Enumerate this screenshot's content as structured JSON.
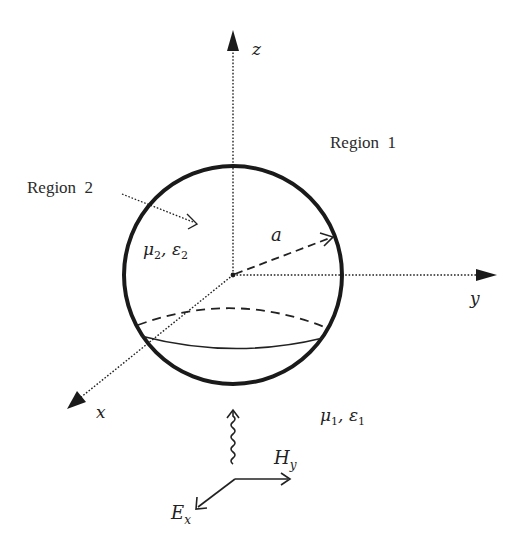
{
  "figure": {
    "colors": {
      "ink": "#222222",
      "background": "#ffffff"
    },
    "axes": {
      "z": {
        "label": "z"
      },
      "y": {
        "label": "y"
      },
      "x": {
        "label": "x"
      }
    },
    "regions": {
      "region1": {
        "label": "Region  1",
        "params": {
          "mu": "μ",
          "mu_sub": "1",
          "sep": ", ",
          "eps": "ε",
          "eps_sub": "1"
        }
      },
      "region2": {
        "label": "Region  2",
        "params": {
          "mu": "μ",
          "mu_sub": "2",
          "sep": ", ",
          "eps": "ε",
          "eps_sub": "2"
        }
      }
    },
    "radius_label": "a",
    "incident_wave": {
      "H": {
        "base": "H",
        "sub": "y"
      },
      "E": {
        "base": "E",
        "sub": "x"
      }
    }
  }
}
